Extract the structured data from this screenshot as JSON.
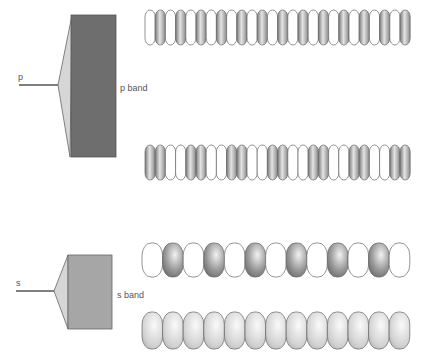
{
  "figure": {
    "p_section": {
      "input_label": "p",
      "band_label": "p band",
      "band_color": "#6e6e6e",
      "funnel_color": "#d6d6d6",
      "chains": [
        {
          "name": "p-chain-top",
          "pattern": "alternating-single",
          "bead_count": 26,
          "shaded": "#9a9a9a"
        },
        {
          "name": "p-chain-bottom",
          "pattern": "alternating-pairs",
          "bead_count": 26,
          "shaded": "#9a9a9a"
        }
      ]
    },
    "s_section": {
      "input_label": "s",
      "band_label": "s band",
      "band_color": "#a6a6a6",
      "funnel_color": "#d6d6d6",
      "chains": [
        {
          "name": "s-chain-top",
          "pattern": "alternating-single",
          "bead_count": 13,
          "shaded": "#8c8c8c"
        },
        {
          "name": "s-chain-bottom",
          "pattern": "all-filled",
          "bead_count": 13,
          "shaded": "#d4d4d4"
        }
      ]
    }
  }
}
